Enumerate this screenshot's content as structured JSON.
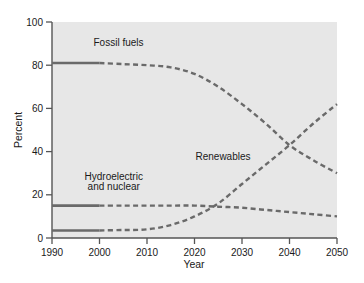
{
  "chart_data": {
    "type": "line",
    "title": "",
    "xlabel": "Year",
    "ylabel": "Percent",
    "xlim": [
      1990,
      2050
    ],
    "ylim": [
      0,
      100
    ],
    "xticks": [
      1990,
      2000,
      2010,
      2020,
      2030,
      2040,
      2050
    ],
    "yticks": [
      0,
      20,
      40,
      60,
      80,
      100
    ],
    "xticklabels": [
      "1990",
      "2000",
      "2010",
      "2020",
      "2030",
      "2040",
      "2050"
    ],
    "yticklabels": [
      "0",
      "20",
      "40",
      "60",
      "80",
      "100"
    ],
    "grid": false,
    "legend": "inline-annotations",
    "plot_background": "#e7e7e7",
    "line_color": "#6a6a6a",
    "historical_range": [
      1990,
      2000
    ],
    "projected_range": [
      2000,
      2050
    ],
    "note": "Solid segments are historical (1990-2000); dashed segments are projected (2000-2050).",
    "series": [
      {
        "name": "Fossil fuels",
        "color": "#6a6a6a",
        "label_x": 2004,
        "label_y": 89,
        "x": [
          1990,
          1995,
          2000,
          2005,
          2010,
          2015,
          2020,
          2025,
          2030,
          2035,
          2040,
          2045,
          2050
        ],
        "values": [
          81,
          81,
          81,
          80.5,
          80,
          79,
          76,
          70,
          62,
          53,
          43,
          36,
          30
        ]
      },
      {
        "name": "Hydroelectric and nuclear",
        "color": "#6a6a6a",
        "label_x": 2003,
        "label_y": 25,
        "label_lines": [
          "Hydroelectric",
          "and nuclear"
        ],
        "x": [
          1990,
          1995,
          2000,
          2005,
          2010,
          2015,
          2020,
          2025,
          2030,
          2035,
          2040,
          2045,
          2050
        ],
        "values": [
          15,
          15,
          15,
          15,
          15,
          15,
          15,
          14.5,
          14,
          13,
          12,
          11,
          10
        ]
      },
      {
        "name": "Renewables",
        "color": "#6a6a6a",
        "label_x": 2026,
        "label_y": 36,
        "x": [
          1990,
          1995,
          2000,
          2005,
          2010,
          2015,
          2020,
          2025,
          2030,
          2035,
          2040,
          2045,
          2050
        ],
        "values": [
          3.5,
          3.5,
          3.5,
          3.7,
          4,
          6,
          10,
          16,
          25,
          34,
          43,
          53,
          62
        ]
      }
    ],
    "annotations": [
      {
        "text": "Fossil fuels",
        "x": 2004,
        "y": 89
      },
      {
        "text": "Hydroelectric",
        "x": 2003,
        "y": 27
      },
      {
        "text": "and nuclear",
        "x": 2003,
        "y": 22
      },
      {
        "text": "Renewables",
        "x": 2026,
        "y": 36
      }
    ]
  }
}
